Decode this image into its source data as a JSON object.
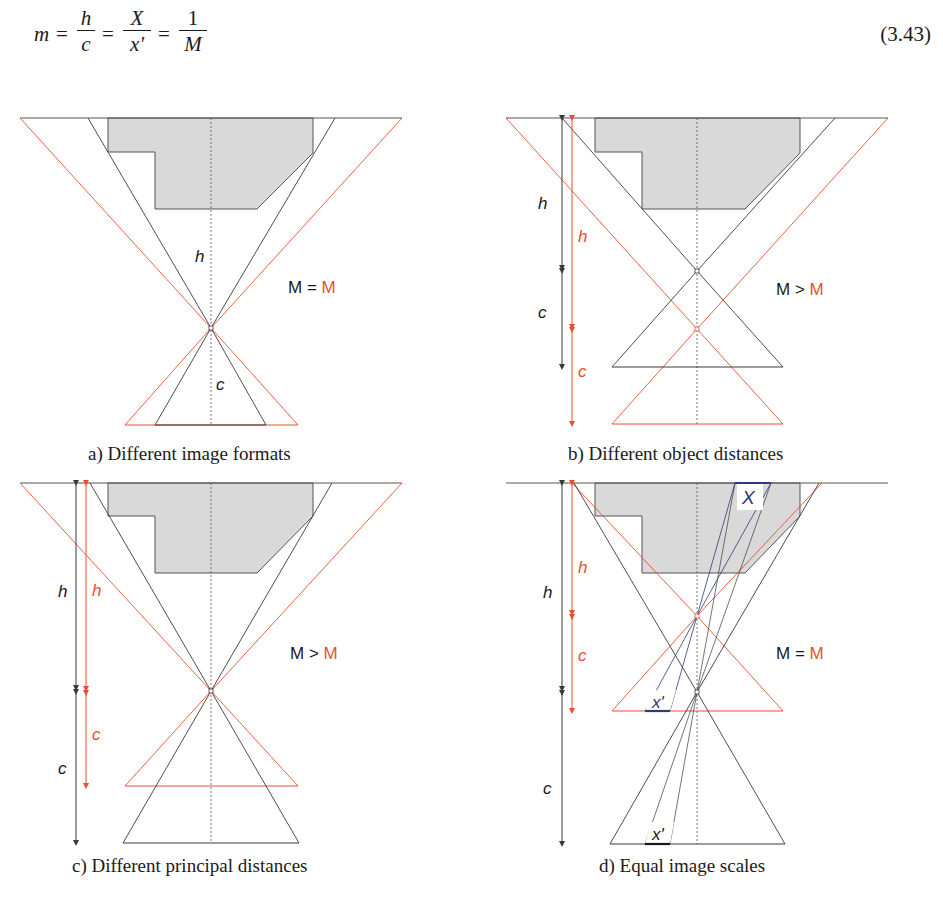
{
  "equation": {
    "lhs": "m",
    "fractions": [
      {
        "num": "h",
        "den": "c"
      },
      {
        "num": "X",
        "den": "x'"
      },
      {
        "num": "1",
        "den": "M"
      }
    ],
    "equals": "=",
    "number": "(3.43)"
  },
  "colors": {
    "black_line": "#3a3a3a",
    "orange": "#e8502d",
    "gray_fill": "#d9d9d9",
    "blue": "#2b3a7a"
  },
  "panels": [
    {
      "id": "a",
      "caption": "a) Different image formats",
      "relation": {
        "left": "M",
        "op": "=",
        "right": "M"
      },
      "labels": {
        "h": "h",
        "c": "c"
      }
    },
    {
      "id": "b",
      "caption": "b) Different object distances",
      "relation": {
        "left": "M",
        "op": ">",
        "right": "M"
      },
      "labels": {
        "h_black": "h",
        "c_black": "c",
        "h_orange": "h",
        "c_orange": "c"
      }
    },
    {
      "id": "c",
      "caption": "c) Different principal distances",
      "relation": {
        "left": "M",
        "op": ">",
        "right": "M"
      },
      "labels": {
        "h_black": "h",
        "c_black": "c",
        "h_orange": "h",
        "c_orange": "c"
      }
    },
    {
      "id": "d",
      "caption": "d) Equal image scales",
      "relation": {
        "left": "M",
        "op": "=",
        "right": "M"
      },
      "labels": {
        "h_black": "h",
        "c_black": "c",
        "h_orange": "h",
        "c_orange": "c",
        "object": "X",
        "image_orange": "x'",
        "image_black": "x'"
      }
    }
  ]
}
